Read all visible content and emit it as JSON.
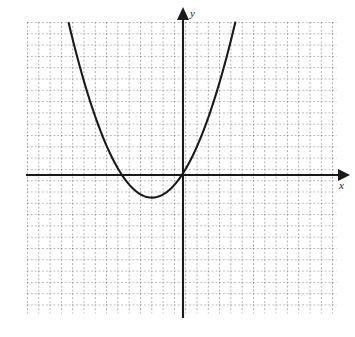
{
  "figure": {
    "kind": "coordinate-graph",
    "background_color": "#ffffff",
    "ink_color": "#1a1a1a",
    "grid_color": "#555555"
  },
  "axes": {
    "x_label": "x",
    "y_label": "y",
    "x_axis_name": "horizontal-axis",
    "y_axis_name": "vertical-axis",
    "origin_px": [
      183,
      175
    ],
    "unit_px": 11.3,
    "x_arrow": "right-arrowhead",
    "y_arrow": "up-arrowhead"
  },
  "grid": {
    "style": "dotted",
    "left_px": 27,
    "right_px": 336,
    "top_px": 22,
    "bottom_px": 313,
    "spacing_px": 11.3,
    "columns": 28,
    "rows": 26
  },
  "chart_data": {
    "type": "line",
    "title": "",
    "xlabel": "x",
    "ylabel": "y",
    "grid": true,
    "legend": "none",
    "curve_name": "parabola",
    "vertex": [
      -2.75,
      -2.0
    ],
    "roots": [
      -5.4,
      -0.05
    ],
    "xlim": [
      -13.8,
      13.5
    ],
    "ylim": [
      -12.2,
      13.5
    ],
    "x": [
      -9.3,
      -8.8,
      -8.3,
      -7.8,
      -7.3,
      -6.8,
      -6.3,
      -5.8,
      -5.3,
      -4.8,
      -4.3,
      -3.8,
      -3.3,
      -2.8,
      -2.3,
      -1.8,
      -1.3,
      -0.8,
      -0.3,
      0.2,
      0.7,
      1.2,
      1.7,
      2.2,
      2.7,
      3.2,
      3.7,
      4.0
    ],
    "y": [
      13.5,
      11.2,
      9.1,
      7.1,
      5.3,
      3.6,
      2.1,
      0.8,
      -0.4,
      -1.1,
      -1.7,
      -1.95,
      -2.0,
      -2.0,
      -1.85,
      -1.5,
      -1.0,
      -0.35,
      0.45,
      1.4,
      2.5,
      3.8,
      5.2,
      6.8,
      8.5,
      10.4,
      12.4,
      13.5
    ],
    "series": [
      {
        "name": "parabola",
        "points_px": [
          [
            78,
            22
          ],
          [
            84,
            39
          ],
          [
            90,
            56
          ],
          [
            96,
            71
          ],
          [
            102,
            86
          ],
          [
            108,
            100
          ],
          [
            114,
            112
          ],
          [
            120,
            125
          ],
          [
            126,
            137
          ],
          [
            132,
            147
          ],
          [
            138,
            157
          ],
          [
            144,
            166
          ],
          [
            150,
            172
          ],
          [
            152,
            176
          ],
          [
            152,
            197
          ],
          [
            158,
            196
          ],
          [
            164,
            193
          ],
          [
            170,
            189
          ],
          [
            176,
            183
          ],
          [
            182,
            175
          ],
          [
            188,
            166
          ],
          [
            194,
            155
          ],
          [
            200,
            143
          ],
          [
            206,
            130
          ],
          [
            212,
            115
          ],
          [
            218,
            98
          ],
          [
            224,
            79
          ],
          [
            228,
            22
          ]
        ]
      }
    ]
  }
}
